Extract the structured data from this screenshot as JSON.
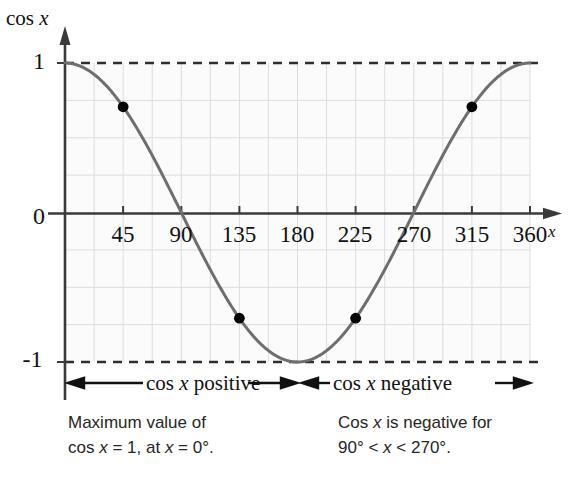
{
  "chart_data": {
    "type": "line",
    "title": "",
    "ylabel": "cos x",
    "xlabel": "x",
    "xlim": [
      0,
      360
    ],
    "ylim": [
      -1,
      1
    ],
    "grid": true,
    "legend_position": "none",
    "x_tick_labels": [
      "45",
      "90",
      "135",
      "180",
      "225",
      "270",
      "315",
      "360"
    ],
    "x_tick_values": [
      45,
      90,
      135,
      180,
      225,
      270,
      315,
      360
    ],
    "y_tick_labels": [
      "1",
      "0",
      "-1"
    ],
    "y_tick_values": [
      1,
      0,
      -1
    ],
    "series": [
      {
        "name": "cos x",
        "x": [
          0,
          15,
          30,
          45,
          60,
          75,
          90,
          105,
          120,
          135,
          150,
          165,
          180,
          195,
          210,
          225,
          240,
          255,
          270,
          285,
          300,
          315,
          330,
          345,
          360
        ],
        "values": [
          1,
          0.966,
          0.866,
          0.707,
          0.5,
          0.259,
          0,
          -0.259,
          -0.5,
          -0.707,
          -0.866,
          -0.966,
          -1,
          -0.966,
          -0.866,
          -0.707,
          -0.5,
          -0.259,
          0,
          0.259,
          0.5,
          0.707,
          0.866,
          0.966,
          1
        ]
      }
    ],
    "marked_points": [
      {
        "x": 45,
        "y": 0.707
      },
      {
        "x": 135,
        "y": -0.707
      },
      {
        "x": 225,
        "y": -0.707
      },
      {
        "x": 315,
        "y": 0.707
      }
    ],
    "reference_lines": [
      {
        "y": 1,
        "style": "dashed"
      },
      {
        "y": -1,
        "style": "dashed"
      }
    ],
    "colors": {
      "curve": "#6e6e6e",
      "grid": "#d8d8d8",
      "axis": "#3a3a3a",
      "dashed": "#2e2e2e",
      "point": "#000000"
    }
  },
  "axis": {
    "y_title_prefix": "cos ",
    "y_title_var": "x",
    "x_title": "x"
  },
  "y_ticks": [
    {
      "label": "1"
    },
    {
      "label": "0"
    },
    {
      "label": "-1"
    }
  ],
  "x_ticks": [
    {
      "label": "45"
    },
    {
      "label": "90"
    },
    {
      "label": "135"
    },
    {
      "label": "180"
    },
    {
      "label": "225"
    },
    {
      "label": "270"
    },
    {
      "label": "315"
    },
    {
      "label": "360"
    }
  ],
  "range_notes": {
    "positive": {
      "arrow_left": "←",
      "text_prefix": "cos ",
      "text_var": "x",
      "text_suffix": " positive ",
      "arrow_right": "→"
    },
    "negative": {
      "arrow_left": "←",
      "text_prefix": "cos ",
      "text_var": "x",
      "text_suffix": " negative",
      "arrow_right": "→"
    }
  },
  "captions": {
    "left": {
      "line1": "Maximum value of",
      "line2_a": "cos ",
      "line2_var": "x",
      "line2_b": " = 1, at ",
      "line2_var2": "x",
      "line2_c": " = 0°."
    },
    "right": {
      "line1_a": "Cos ",
      "line1_var": "x",
      "line1_b": " is negative for",
      "line2_a": "90° < ",
      "line2_var": "x",
      "line2_b": " < 270°."
    }
  }
}
